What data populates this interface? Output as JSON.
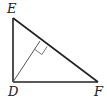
{
  "diagram": {
    "type": "geometry",
    "vertices": {
      "E": {
        "label": "E",
        "x": 13,
        "y": 18
      },
      "D": {
        "label": "D",
        "x": 13,
        "y": 82
      },
      "F": {
        "label": "F",
        "x": 98,
        "y": 82
      }
    },
    "altitude_foot": {
      "x": 40,
      "y": 41
    },
    "right_angle_marker_at": "altitude_foot",
    "colors": {
      "triangle_stroke": "#222222",
      "altitude_stroke": "#555555",
      "marker_stroke": "#777777"
    }
  }
}
